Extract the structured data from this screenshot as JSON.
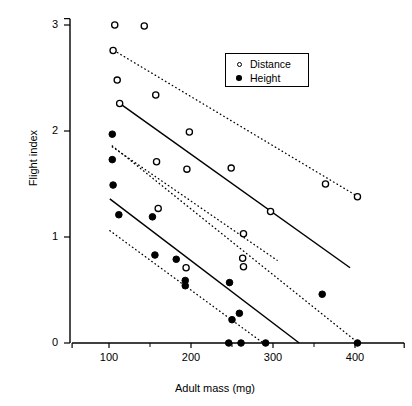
{
  "chart_data": {
    "type": "scatter",
    "title": "",
    "xlabel": "Adult mass (mg)",
    "ylabel": "Flight index",
    "xlim": [
      55,
      460
    ],
    "ylim": [
      0,
      3.1
    ],
    "xticks": [
      100,
      200,
      300,
      400
    ],
    "xtick_labels": [
      "100",
      "200",
      "300",
      "400"
    ],
    "yticks": [
      0,
      1,
      2,
      3
    ],
    "ytick_labels": [
      "0",
      "1",
      "2",
      "3"
    ],
    "grid": false,
    "legend": {
      "position": "top-right",
      "entries": [
        {
          "label": "Distance",
          "marker": "open-circle"
        },
        {
          "label": "Height",
          "marker": "filled-circle"
        }
      ]
    },
    "series": [
      {
        "name": "Distance",
        "marker": "open-circle",
        "points": [
          {
            "x": 107,
            "y": 3.0
          },
          {
            "x": 143,
            "y": 2.99
          },
          {
            "x": 105,
            "y": 2.76
          },
          {
            "x": 110,
            "y": 2.48
          },
          {
            "x": 157,
            "y": 2.34
          },
          {
            "x": 113,
            "y": 2.26
          },
          {
            "x": 198,
            "y": 1.99
          },
          {
            "x": 158,
            "y": 1.71
          },
          {
            "x": 195,
            "y": 1.64
          },
          {
            "x": 249,
            "y": 1.65
          },
          {
            "x": 160,
            "y": 1.27
          },
          {
            "x": 264,
            "y": 1.03
          },
          {
            "x": 297,
            "y": 1.24
          },
          {
            "x": 263,
            "y": 0.8
          },
          {
            "x": 264,
            "y": 0.72
          },
          {
            "x": 194,
            "y": 0.71
          },
          {
            "x": 364,
            "y": 1.5
          },
          {
            "x": 403,
            "y": 1.38
          }
        ]
      },
      {
        "name": "Height",
        "marker": "filled-circle",
        "points": [
          {
            "x": 104,
            "y": 1.97
          },
          {
            "x": 104,
            "y": 1.73
          },
          {
            "x": 105,
            "y": 1.49
          },
          {
            "x": 112,
            "y": 1.21
          },
          {
            "x": 153,
            "y": 1.19
          },
          {
            "x": 156,
            "y": 0.83
          },
          {
            "x": 182,
            "y": 0.79
          },
          {
            "x": 193,
            "y": 0.59
          },
          {
            "x": 193,
            "y": 0.54
          },
          {
            "x": 247,
            "y": 0.57
          },
          {
            "x": 259,
            "y": 0.28
          },
          {
            "x": 250,
            "y": 0.22
          },
          {
            "x": 360,
            "y": 0.46
          },
          {
            "x": 246,
            "y": 0.0
          },
          {
            "x": 261,
            "y": 0.0
          },
          {
            "x": 291,
            "y": 0.0
          },
          {
            "x": 403,
            "y": 0.0
          }
        ]
      }
    ],
    "fit_lines": [
      {
        "name": "distance-fit",
        "style": "solid",
        "x1": 113,
        "y1": 2.26,
        "x2": 394,
        "y2": 0.71
      },
      {
        "name": "height-fit",
        "style": "solid",
        "x1": 101,
        "y1": 1.36,
        "x2": 332,
        "y2": 0.0
      }
    ],
    "confidence_bands": [
      {
        "name": "distance-upper-band",
        "style": "dotted",
        "x1": 106,
        "y1": 2.76,
        "x2": 406,
        "y2": 1.37
      },
      {
        "name": "distance-lower-band",
        "style": "dotted",
        "x1": 104,
        "y1": 1.86,
        "x2": 404,
        "y2": 0.0
      },
      {
        "name": "height-upper-band",
        "style": "dotted",
        "x1": 104,
        "y1": 1.85,
        "x2": 305,
        "y2": 0.78
      },
      {
        "name": "height-lower-band",
        "style": "dotted",
        "x1": 101,
        "y1": 1.06,
        "x2": 288,
        "y2": 0.0
      }
    ]
  },
  "axes": {
    "x_title": "Adult mass (mg)",
    "y_title": "Flight index"
  }
}
